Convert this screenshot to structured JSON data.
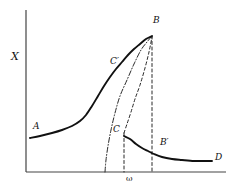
{
  "figure": {
    "background_color": "#ffffff",
    "line_color": "#111111",
    "axis_color": "#444444"
  },
  "axes": {
    "y_label": "X",
    "x_label": "ω",
    "y_axis": {
      "x": 26,
      "y_top": 10,
      "y_bottom": 172
    },
    "x_axis": {
      "y": 172,
      "x_left": 26,
      "x_right": 226
    },
    "grid": false,
    "ticks": []
  },
  "labels": [
    {
      "name": "point-label-A",
      "text": "A",
      "x": 33,
      "y": 122
    },
    {
      "name": "point-label-B",
      "text": "B",
      "x": 153,
      "y": 16
    },
    {
      "name": "point-label-C-prime",
      "text": "C′",
      "x": 110,
      "y": 57
    },
    {
      "name": "point-label-C",
      "text": "C",
      "x": 113,
      "y": 125
    },
    {
      "name": "point-label-B-prime",
      "text": "B′",
      "x": 160,
      "y": 138
    },
    {
      "name": "point-label-D",
      "text": "D",
      "x": 215,
      "y": 153
    }
  ],
  "chart_data": {
    "type": "line",
    "xlabel": "ω",
    "ylabel": "X",
    "grid": false,
    "legend": null,
    "annotations": [
      {
        "label": "A",
        "meaning": "low-amplitude branch start",
        "x": 33,
        "y": 122
      },
      {
        "label": "B",
        "meaning": "upper jump / peak amplitude point",
        "x": 153,
        "y": 16
      },
      {
        "label": "C′",
        "meaning": "upper branch marker",
        "x": 110,
        "y": 57
      },
      {
        "label": "C",
        "meaning": "lower jump point",
        "x": 113,
        "y": 125
      },
      {
        "label": "B′",
        "meaning": "lower branch point below B",
        "x": 160,
        "y": 138
      },
      {
        "label": "D",
        "meaning": "high-frequency branch end",
        "x": 215,
        "y": 153
      }
    ],
    "series": [
      {
        "name": "lower-left-branch-A-to-B",
        "style": "solid",
        "description": "Solid response curve rising from A through C' to peak B",
        "points": [
          [
            30,
            138
          ],
          [
            40,
            136
          ],
          [
            52,
            133
          ],
          [
            62,
            130
          ],
          [
            72,
            126
          ],
          [
            80,
            121
          ],
          [
            86,
            115
          ],
          [
            92,
            106
          ],
          [
            98,
            96
          ],
          [
            104,
            86
          ],
          [
            110,
            77
          ],
          [
            116,
            69
          ],
          [
            122,
            62
          ],
          [
            128,
            55
          ],
          [
            134,
            49
          ],
          [
            140,
            44
          ],
          [
            146,
            39
          ],
          [
            152,
            36
          ]
        ]
      },
      {
        "name": "right-branch-C-to-D",
        "style": "solid",
        "description": "Solid response curve descending from C through B' to D",
        "points": [
          [
            124,
            136
          ],
          [
            130,
            139
          ],
          [
            136,
            144
          ],
          [
            142,
            148
          ],
          [
            148,
            151
          ],
          [
            154,
            154
          ],
          [
            162,
            157
          ],
          [
            172,
            159
          ],
          [
            182,
            160
          ],
          [
            194,
            161
          ],
          [
            204,
            161
          ],
          [
            212,
            161
          ]
        ]
      },
      {
        "name": "unstable-branch-C-to-B",
        "style": "dashed",
        "description": "Dashed unstable branch connecting C to B",
        "points": [
          [
            124,
            133
          ],
          [
            127,
            124
          ],
          [
            131,
            112
          ],
          [
            135,
            99
          ],
          [
            140,
            85
          ],
          [
            145,
            68
          ],
          [
            149,
            52
          ],
          [
            152,
            37
          ]
        ]
      },
      {
        "name": "backbone-curve",
        "style": "dash-dot",
        "description": "Dash-dot backbone (free-oscillation) curve from axis up to B",
        "points": [
          [
            105,
            172
          ],
          [
            106,
            160
          ],
          [
            108,
            146
          ],
          [
            111,
            130
          ],
          [
            115,
            113
          ],
          [
            120,
            96
          ],
          [
            127,
            80
          ],
          [
            134,
            64
          ],
          [
            141,
            50
          ],
          [
            147,
            42
          ],
          [
            152,
            36
          ]
        ]
      },
      {
        "name": "vertical-drop-at-B",
        "style": "dashed",
        "description": "Vertical dashed line from peak B down to the ω axis",
        "points": [
          [
            152,
            36
          ],
          [
            152,
            172
          ]
        ]
      },
      {
        "name": "vertical-drop-at-C",
        "style": "dashed",
        "description": "Vertical dashed line from C down to the ω axis",
        "points": [
          [
            124,
            133
          ],
          [
            124,
            172
          ]
        ]
      }
    ],
    "xlim": [
      26,
      226
    ],
    "ylim": [
      172,
      10
    ]
  }
}
